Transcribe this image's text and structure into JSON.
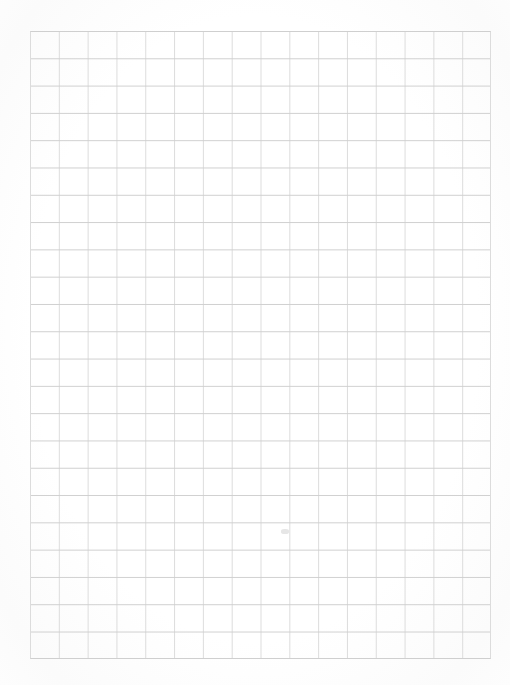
{
  "document": {
    "kind": "grid-ruled-paper-scan",
    "page_width": 510,
    "page_height": 685,
    "background_color": "#ffffff",
    "content_text": "",
    "annotation_text": ""
  },
  "grid": {
    "left": 30,
    "top": 31,
    "right": 491,
    "bottom": 659,
    "width": 461,
    "height": 628,
    "columns": 16,
    "rows": 23,
    "cell_width": 28.8,
    "cell_height": 27.3,
    "vertical_line_color": "#dcdcdc",
    "vertical_line_width": 1,
    "horizontal_line_color": "#cfcfcf",
    "horizontal_line_width": 1.4,
    "border_color": "#d4d4d4",
    "border_width": 1
  },
  "marks": {
    "smudge": {
      "label": "faint-smudge",
      "left": 281,
      "top": 529,
      "width": 8,
      "height": 5,
      "color": "#e6e6e6"
    },
    "margin_note": {
      "label": "margin-note",
      "text": "",
      "left": 436,
      "top": 666,
      "font_size": 6,
      "color": "#f2f2f2"
    }
  },
  "paper": {
    "vignette_color": "#fbfbfb",
    "edge_color": "#fdfdfd"
  }
}
